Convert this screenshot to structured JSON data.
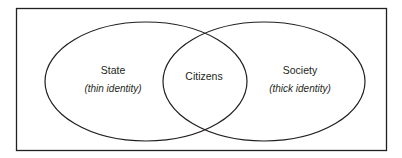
{
  "diagram": {
    "type": "venn",
    "sets": [
      {
        "id": "state",
        "label": "State",
        "sublabel": "(thin identity)"
      },
      {
        "id": "society",
        "label": "Society",
        "sublabel": "(thick identity)"
      }
    ],
    "intersection": {
      "label": "Citizens",
      "sets": [
        "state",
        "society"
      ]
    },
    "colors": {
      "stroke": "#231f20",
      "background": "#ffffff",
      "text": "#231f20"
    }
  }
}
